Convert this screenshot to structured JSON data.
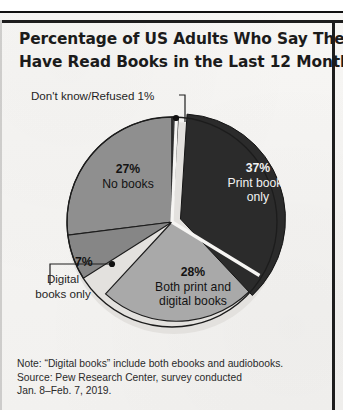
{
  "page": {
    "background_color": "#f6f5f3",
    "frame_color": "#1d1d1d"
  },
  "title": {
    "line1": "Percentage of US Adults Who Say They",
    "line2": "Have Read Books in the Last 12 Months"
  },
  "callouts": {
    "dont_know": "Don't know/Refused 1%",
    "digital_books_only_line1": "Digital",
    "digital_books_only_line2": "books only"
  },
  "labels": {
    "print_pct": "37%",
    "print_name_line1": "Print books",
    "print_name_line2": "only",
    "nobooks_pct": "27%",
    "nobooks_name": "No books",
    "both_pct": "28%",
    "both_name_line1": "Both print and",
    "both_name_line2": "digital books",
    "digital_pct": "7%"
  },
  "footnote": {
    "line1": "Note: “Digital books” include both ebooks and audiobooks.",
    "line2": "Source: Pew Research Center, survey conducted",
    "line3": "Jan. 8–Feb. 7, 2019."
  },
  "chart_data": {
    "type": "pie",
    "title": "Percentage of US Adults Who Say They Have Read Books in the Last 12 Months",
    "subtitle": "",
    "xlabel": "",
    "ylabel": "",
    "unit": "percent",
    "total": 100,
    "legend_position": "none",
    "grid": false,
    "note": "“Digital books” include both ebooks and audiobooks.",
    "source": "Pew Research Center, survey conducted Jan. 8–Feb. 7, 2019.",
    "categories": [
      "Print books only",
      "Both print and digital books",
      "Digital books only",
      "No books",
      "Don't know/Refused"
    ],
    "values": [
      37,
      28,
      7,
      27,
      1
    ],
    "labels": [
      "37%",
      "28%",
      "7%",
      "27%",
      "1%"
    ],
    "colors": [
      "#2b2b2b",
      "#a9a9a9",
      "#868686",
      "#8f8f8f",
      "#3a3a3a"
    ],
    "exploded": [
      true,
      false,
      false,
      false,
      false
    ],
    "label_placement": [
      "inside",
      "inside",
      "callout",
      "inside",
      "callout"
    ],
    "start_angle_deg": 0,
    "direction": "clockwise",
    "geometry": {
      "center_x": 172,
      "center_y": 222,
      "radius": 105,
      "explode_offset_px": 9
    }
  }
}
